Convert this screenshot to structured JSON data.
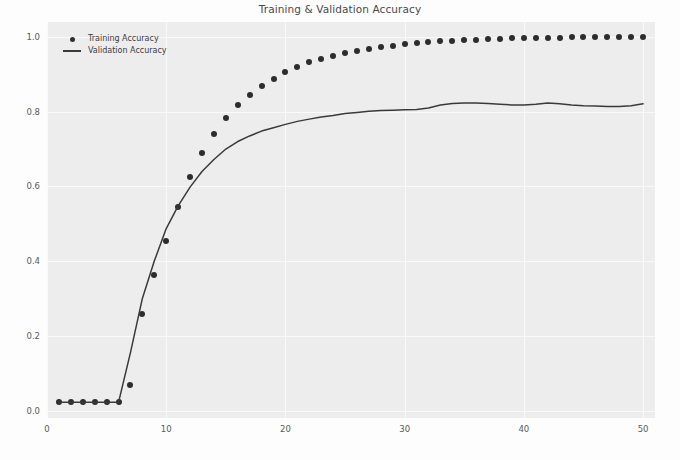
{
  "figure": {
    "title": "Training & Validation Accuracy",
    "background_color": "#ededed",
    "grid_color": "#fafafa",
    "marker_color": "#2d2d2d",
    "line_color": "#3a3a3a"
  },
  "legend": {
    "position": "upper left",
    "entries": [
      {
        "label": "Training Accuracy",
        "marker": "dot-marker"
      },
      {
        "label": "Validation Accuracy",
        "marker": "line-marker"
      }
    ]
  },
  "axes": {
    "xticks": [
      "0",
      "10",
      "20",
      "30",
      "40",
      "50"
    ],
    "yticks": [
      "1.0",
      "0.8",
      "0.6",
      "0.4",
      "0.2",
      "0.0"
    ],
    "xlabel": "",
    "ylabel": ""
  },
  "ghost_text": [
    "the training curve rises and the validation accuracy begins",
    "to converge near the upper plateau of the measured range",
    "conditions the final accuracy of the network reaching a",
    "separation between the curves indicates mild overfitting",
    "epoch count and batch size were held constant across runs",
    "the model was evaluated on a held out validation split"
  ],
  "chart_data": {
    "type": "line",
    "title": "Training & Validation Accuracy",
    "xlabel": "",
    "ylabel": "",
    "xlim": [
      0,
      51
    ],
    "ylim": [
      -0.02,
      1.04
    ],
    "grid": true,
    "legend_position": "upper left",
    "x": [
      1,
      2,
      3,
      4,
      5,
      6,
      7,
      8,
      9,
      10,
      11,
      12,
      13,
      14,
      15,
      16,
      17,
      18,
      19,
      20,
      21,
      22,
      23,
      24,
      25,
      26,
      27,
      28,
      29,
      30,
      31,
      32,
      33,
      34,
      35,
      36,
      37,
      38,
      39,
      40,
      41,
      42,
      43,
      44,
      45,
      46,
      47,
      48,
      49,
      50
    ],
    "series": [
      {
        "name": "Training Accuracy",
        "style": "scatter",
        "marker": "o",
        "values": [
          0.022,
          0.022,
          0.022,
          0.022,
          0.022,
          0.022,
          0.068,
          0.258,
          0.362,
          0.455,
          0.545,
          0.625,
          0.69,
          0.74,
          0.782,
          0.818,
          0.845,
          0.868,
          0.888,
          0.905,
          0.92,
          0.932,
          0.942,
          0.95,
          0.957,
          0.963,
          0.968,
          0.972,
          0.976,
          0.98,
          0.983,
          0.986,
          0.988,
          0.99,
          0.992,
          0.993,
          0.994,
          0.995,
          0.996,
          0.997,
          0.997,
          0.998,
          0.998,
          0.999,
          0.999,
          0.999,
          1.0,
          1.0,
          1.0,
          1.0
        ]
      },
      {
        "name": "Validation Accuracy",
        "style": "line",
        "values": [
          0.022,
          0.022,
          0.022,
          0.022,
          0.022,
          0.022,
          0.155,
          0.3,
          0.4,
          0.487,
          0.548,
          0.598,
          0.64,
          0.672,
          0.7,
          0.72,
          0.735,
          0.748,
          0.757,
          0.766,
          0.774,
          0.78,
          0.786,
          0.79,
          0.795,
          0.798,
          0.801,
          0.803,
          0.804,
          0.805,
          0.806,
          0.81,
          0.818,
          0.822,
          0.823,
          0.823,
          0.822,
          0.82,
          0.818,
          0.818,
          0.82,
          0.823,
          0.821,
          0.818,
          0.816,
          0.815,
          0.814,
          0.814,
          0.816,
          0.821
        ]
      }
    ]
  }
}
